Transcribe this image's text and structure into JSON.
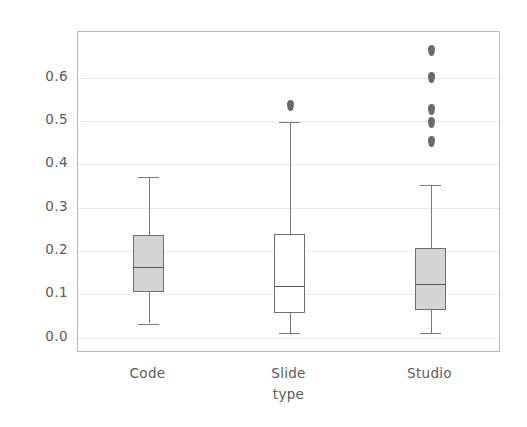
{
  "chart_data": {
    "type": "box",
    "title": "",
    "xlabel": "type",
    "ylabel": "video_average_watching_rate",
    "categories": [
      "Code",
      "Slide",
      "Studio"
    ],
    "ylim": [
      -0.035,
      0.705
    ],
    "ytick_labels": [
      "0.0",
      "0.1",
      "0.2",
      "0.3",
      "0.4",
      "0.5",
      "0.6"
    ],
    "ytick_values": [
      0.0,
      0.1,
      0.2,
      0.3,
      0.4,
      0.5,
      0.6
    ],
    "grid": true,
    "legend": "none",
    "boxes": [
      {
        "name": "Code",
        "whisker_low": 0.033,
        "q1": 0.105,
        "median": 0.164,
        "q3": 0.236,
        "whisker_high": 0.371,
        "fliers": [],
        "fill": "#d4d4d4",
        "edge": "#6f6f6f"
      },
      {
        "name": "Slide",
        "whisker_low": 0.011,
        "q1": 0.057,
        "median": 0.119,
        "q3": 0.239,
        "whisker_high": 0.498,
        "fliers": [
          0.536
        ],
        "fill": "#ffffff",
        "edge": "#6f6f6f"
      },
      {
        "name": "Studio",
        "whisker_low": 0.011,
        "q1": 0.063,
        "median": 0.124,
        "q3": 0.208,
        "whisker_high": 0.352,
        "fliers": [
          0.663,
          0.601,
          0.527,
          0.496,
          0.452
        ],
        "fill": "#d4d4d4",
        "edge": "#6f6f6f"
      }
    ]
  },
  "colors": {
    "axis_frame": "#b9b9b9",
    "gridline": "#e9e9e9",
    "text": "#5b5b5b",
    "box_fill_gray": "#d4d4d4",
    "box_fill_white": "#ffffff",
    "box_edge": "#6f6f6f",
    "flier": "#6a6a6a",
    "background": "#ffffff"
  }
}
